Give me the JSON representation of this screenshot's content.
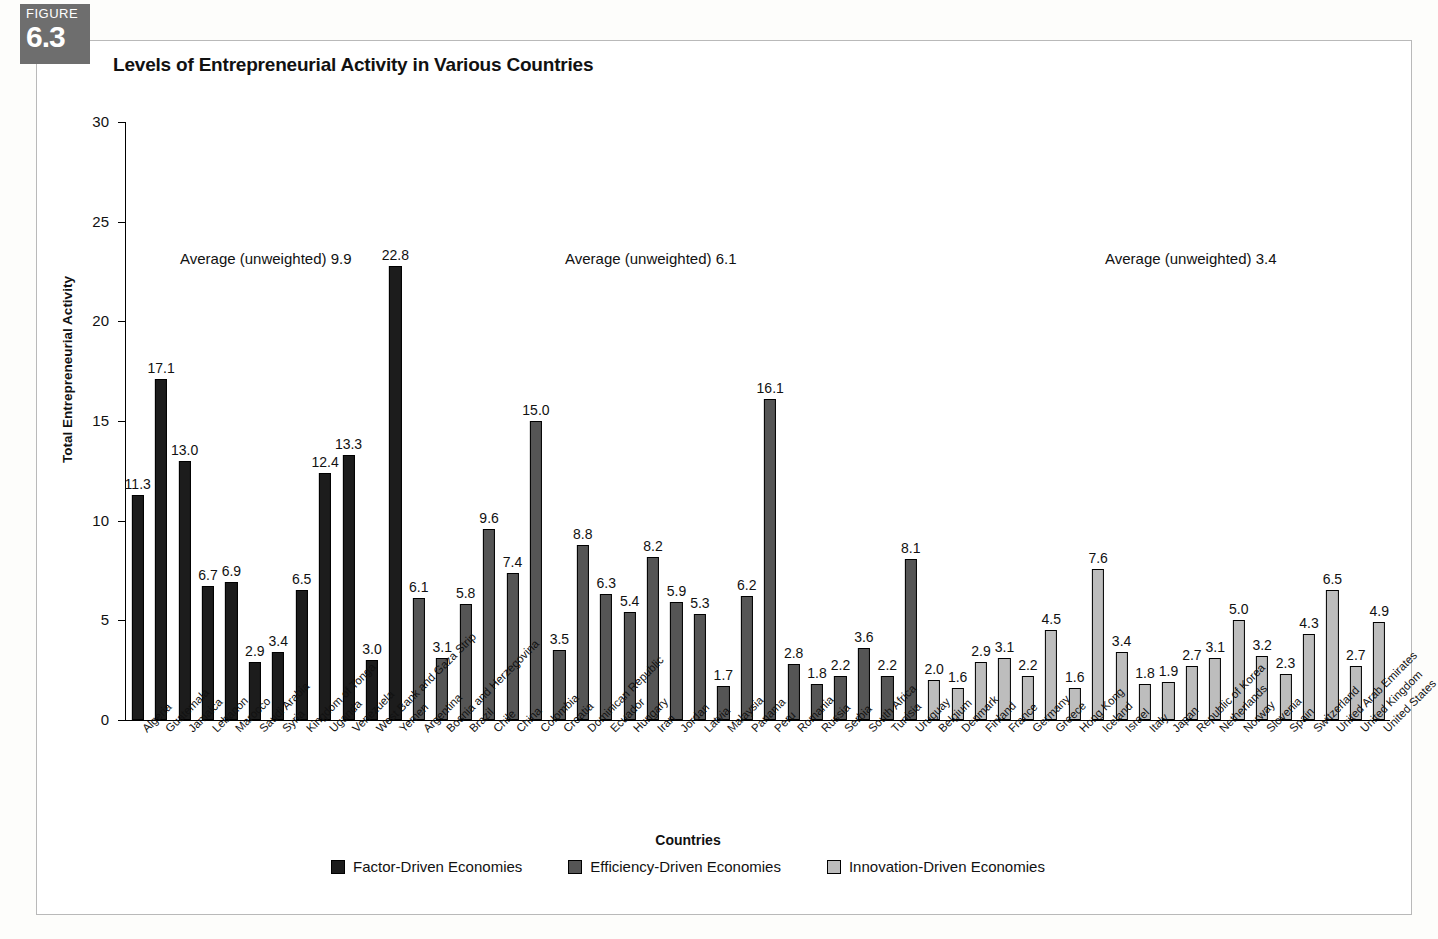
{
  "figure": {
    "word": "FIGURE",
    "number": "6.3"
  },
  "chart_title": "Levels of Entrepreneurial Activity in Various Countries",
  "axis": {
    "x_title": "Countries",
    "y_title": "Total Entrepreneurial Activity"
  },
  "legend": [
    {
      "label": "Factor-Driven Economies",
      "color": "#1c1c1c",
      "key": "factor"
    },
    {
      "label": "Efficiency-Driven Economies",
      "color": "#555555",
      "key": "efficiency"
    },
    {
      "label": "Innovation-Driven Economies",
      "color": "#bdbdbd",
      "key": "innovation"
    }
  ],
  "annotations": [
    {
      "text": "Average (unweighted) 9.9",
      "group": "factor"
    },
    {
      "text": "Average (unweighted) 6.1",
      "group": "efficiency"
    },
    {
      "text": "Average (unweighted) 3.4",
      "group": "innovation"
    }
  ],
  "chart_data": {
    "type": "bar",
    "title": "Levels of Entrepreneurial Activity in Various Countries",
    "xlabel": "Countries",
    "ylabel": "Total Entrepreneurial Activity",
    "ylim": [
      0,
      30
    ],
    "yticks": [
      0,
      5,
      10,
      15,
      20,
      25,
      30
    ],
    "grid": false,
    "legend_position": "bottom",
    "categories": [
      "Algeria",
      "Guatemala",
      "Jamaica",
      "Lebanon",
      "Marocco",
      "Saudi Arabia",
      "Syria",
      "Kingdom of Tonga",
      "Uganda",
      "Venezuela",
      "West Bank and Gaza Strip",
      "Yemen",
      "Argentina",
      "Bosnia and Herzegovina",
      "Brazil",
      "Chile",
      "China",
      "Colombia",
      "Croatia",
      "Dominican Republic",
      "Ecuador",
      "Hungary",
      "Iran",
      "Jordan",
      "Latvia",
      "Malaysia",
      "Panama",
      "Peru",
      "Romania",
      "Russia",
      "Serbia",
      "South Africa",
      "Tunisia",
      "Uruguay",
      "Belgium",
      "Denmark",
      "Finland",
      "France",
      "Germany",
      "Greece",
      "Hong Kong",
      "Iceland",
      "Israel",
      "Italy",
      "Japan",
      "Republic of Korea",
      "Netherlands",
      "Norway",
      "Slovenia",
      "Spain",
      "Switzerland",
      "United Arab Emirates",
      "United Kingdom",
      "United States"
    ],
    "values": [
      11.3,
      17.1,
      13.0,
      6.7,
      6.9,
      2.9,
      3.4,
      6.5,
      12.4,
      13.3,
      3.0,
      22.8,
      6.1,
      3.1,
      5.8,
      9.6,
      7.4,
      15.0,
      3.5,
      8.8,
      6.3,
      5.4,
      8.2,
      5.9,
      5.3,
      1.7,
      6.2,
      16.1,
      2.8,
      1.8,
      2.2,
      3.6,
      2.2,
      8.1,
      2.0,
      1.6,
      2.9,
      3.1,
      2.2,
      4.5,
      1.6,
      7.6,
      3.4,
      1.8,
      1.9,
      2.7,
      3.1,
      5.0,
      3.2,
      2.3,
      4.3,
      6.5,
      2.7,
      4.9
    ],
    "groups": [
      "factor",
      "factor",
      "factor",
      "factor",
      "factor",
      "factor",
      "factor",
      "factor",
      "factor",
      "factor",
      "factor",
      "factor",
      "efficiency",
      "efficiency",
      "efficiency",
      "efficiency",
      "efficiency",
      "efficiency",
      "efficiency",
      "efficiency",
      "efficiency",
      "efficiency",
      "efficiency",
      "efficiency",
      "efficiency",
      "efficiency",
      "efficiency",
      "efficiency",
      "efficiency",
      "efficiency",
      "efficiency",
      "efficiency",
      "efficiency",
      "efficiency",
      "innovation",
      "innovation",
      "innovation",
      "innovation",
      "innovation",
      "innovation",
      "innovation",
      "innovation",
      "innovation",
      "innovation",
      "innovation",
      "innovation",
      "innovation",
      "innovation",
      "innovation",
      "innovation",
      "innovation",
      "innovation",
      "innovation",
      "innovation"
    ],
    "group_averages": {
      "factor": 9.9,
      "efficiency": 6.1,
      "innovation": 3.4
    }
  }
}
